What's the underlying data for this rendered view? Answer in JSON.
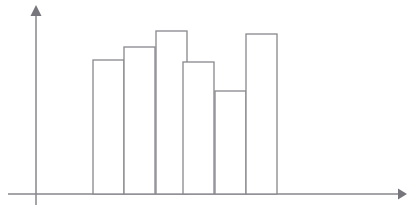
{
  "chart_data": {
    "type": "bar",
    "title": "",
    "subtitle": "",
    "xlabel": "",
    "ylabel": "",
    "categories": [
      "1",
      "2",
      "3",
      "4",
      "5",
      "6"
    ],
    "values": [
      134,
      147,
      163,
      132,
      103,
      160
    ],
    "tops_px": [
      60,
      47,
      31,
      62,
      91,
      34
    ],
    "bar_left_edges_px": [
      93,
      124,
      156,
      183,
      215,
      246
    ],
    "bar_right_edge_px": 277,
    "bar_width_px": 31,
    "baseline_px": 194,
    "xlim": [
      0,
      409
    ],
    "ylim": [
      0,
      194
    ],
    "grid": false,
    "legend": null,
    "legend_position": "none",
    "tick_labels_x": [],
    "tick_labels_y": [],
    "annotations": [],
    "series": [
      {
        "name": "frequency",
        "values": [
          134,
          147,
          163,
          132,
          103,
          160
        ]
      }
    ],
    "style": {
      "bar_fill": "#ffffff",
      "bar_stroke": "#88888e",
      "axis_color": "#86868c",
      "background": "#ffffff",
      "bars_adjacent": true
    }
  },
  "axes": {
    "y_axis": {
      "x_px": 36,
      "top_px": 6,
      "bottom_px": 205,
      "has_arrow": true,
      "arrow_direction": "up"
    },
    "x_axis": {
      "y_px": 194,
      "left_px": 8,
      "right_px": 405,
      "has_arrow": true,
      "arrow_direction": "right"
    }
  }
}
